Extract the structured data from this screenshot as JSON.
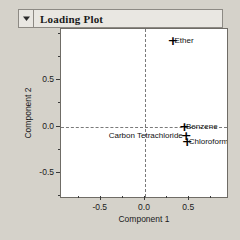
{
  "window": {
    "title": "Loading Plot",
    "disclosure_icon": "triangle-down-icon",
    "background_color": "#d5d2ca",
    "titlebar_color": "#e9e7e2"
  },
  "chart_data": {
    "type": "scatter",
    "title": "Loading Plot",
    "xlabel": "Component 1",
    "ylabel": "Component 2",
    "xlim": [
      -0.95,
      0.95
    ],
    "ylim": [
      -0.78,
      1.05
    ],
    "xticks": [
      "-0.5",
      "0.0",
      "0.5"
    ],
    "xtick_values": [
      -0.5,
      0.0,
      0.5
    ],
    "yticks": [
      "0.5",
      "0.0",
      "-0.5"
    ],
    "ytick_values": [
      0.5,
      0.0,
      -0.5
    ],
    "grid": false,
    "zero_lines": true,
    "legend": "none",
    "marker": "+",
    "marker_color": "#000000",
    "points": [
      {
        "label": "Ether",
        "x": 0.3,
        "y": 0.92,
        "label_pos": "right"
      },
      {
        "label": "Benzene",
        "x": 0.43,
        "y": 0.0,
        "label_pos": "right"
      },
      {
        "label": "Carbon Tetrachloride",
        "x": 0.45,
        "y": -0.1,
        "label_pos": "left"
      },
      {
        "label": "Chloroform",
        "x": 0.46,
        "y": -0.17,
        "label_pos": "right"
      }
    ]
  }
}
